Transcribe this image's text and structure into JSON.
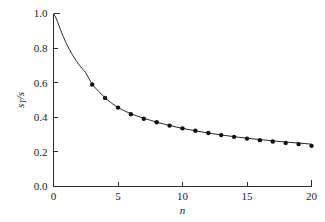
{
  "chart_data": {
    "type": "line",
    "title": "",
    "subtitle": "",
    "xlabel": "n",
    "ylabel": "s_T/s",
    "ylabel_base": "s",
    "ylabel_sub": "T",
    "ylabel_denom": "/s",
    "xlim": [
      0,
      20
    ],
    "ylim": [
      0.0,
      1.0
    ],
    "grid": false,
    "legend": null,
    "x_ticks": [
      0,
      5,
      10,
      15,
      20
    ],
    "x_tick_labels": [
      "0",
      "5",
      "10",
      "15",
      "20"
    ],
    "y_ticks": [
      0.0,
      0.2,
      0.4,
      0.6,
      0.8,
      1.0
    ],
    "y_tick_labels": [
      "0.0",
      "0.2",
      "0.4",
      "0.6",
      "0.8",
      "1.0"
    ],
    "tick_direction": "in",
    "frame": "left-bottom",
    "line_color": "#2b2b2b",
    "marker_color": "#111111",
    "marker_shape": "filled-circle",
    "curve": {
      "name": "theoretical curve",
      "x": [
        0.0,
        0.15,
        0.3,
        0.5,
        0.75,
        1.0,
        1.25,
        1.5,
        1.75,
        2.0,
        2.5,
        3.0,
        3.5,
        4.0,
        4.5,
        5.0,
        5.5,
        6.0,
        6.5,
        7.0,
        7.5,
        8.0,
        8.5,
        9.0,
        9.5,
        10.0,
        11.0,
        12.0,
        13.0,
        14.0,
        15.0,
        16.0,
        17.0,
        18.0,
        19.0,
        20.0
      ],
      "y": [
        1.0,
        0.98,
        0.955,
        0.915,
        0.868,
        0.826,
        0.79,
        0.757,
        0.728,
        0.702,
        0.657,
        0.59,
        0.549,
        0.513,
        0.482,
        0.456,
        0.437,
        0.421,
        0.407,
        0.394,
        0.383,
        0.372,
        0.362,
        0.353,
        0.344,
        0.336,
        0.322,
        0.309,
        0.298,
        0.288,
        0.279,
        0.271,
        0.264,
        0.257,
        0.251,
        0.245
      ]
    },
    "points": {
      "name": "simulation data",
      "x": [
        3,
        4,
        5,
        6,
        7,
        8,
        9,
        10,
        11,
        12,
        13,
        14,
        15,
        16,
        17,
        18,
        19,
        20
      ],
      "y": [
        0.59,
        0.512,
        0.456,
        0.418,
        0.392,
        0.371,
        0.352,
        0.336,
        0.322,
        0.309,
        0.297,
        0.287,
        0.277,
        0.268,
        0.26,
        0.252,
        0.245,
        0.235
      ]
    }
  }
}
